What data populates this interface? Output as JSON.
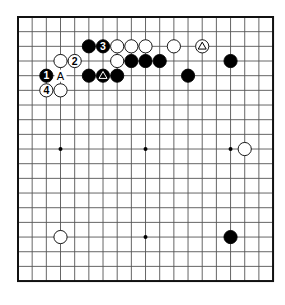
{
  "board": {
    "size": 19,
    "origin_x": 18,
    "origin_y": 17,
    "step_x": 14.17,
    "step_y": 14.67,
    "line_color": "#555555",
    "border_color": "#111111",
    "stone_black": "#000000",
    "stone_white": "#ffffff",
    "star_points": [
      [
        3,
        9
      ],
      [
        9,
        9
      ],
      [
        15,
        9
      ],
      [
        9,
        15
      ]
    ]
  },
  "stones": [
    {
      "color": "black",
      "col": 5,
      "row": 2,
      "label": ""
    },
    {
      "color": "black",
      "col": 6,
      "row": 2,
      "label": "3"
    },
    {
      "color": "white",
      "col": 7,
      "row": 2,
      "label": ""
    },
    {
      "color": "white",
      "col": 8,
      "row": 2,
      "label": ""
    },
    {
      "color": "white",
      "col": 9,
      "row": 2,
      "label": ""
    },
    {
      "color": "white",
      "col": 11,
      "row": 2,
      "label": ""
    },
    {
      "color": "white",
      "col": 13,
      "row": 2,
      "label": "triangle"
    },
    {
      "color": "white",
      "col": 3,
      "row": 3,
      "label": ""
    },
    {
      "color": "white",
      "col": 4,
      "row": 3,
      "label": "2"
    },
    {
      "color": "white",
      "col": 7,
      "row": 3,
      "label": ""
    },
    {
      "color": "black",
      "col": 8,
      "row": 3,
      "label": ""
    },
    {
      "color": "black",
      "col": 9,
      "row": 3,
      "label": ""
    },
    {
      "color": "black",
      "col": 10,
      "row": 3,
      "label": ""
    },
    {
      "color": "black",
      "col": 15,
      "row": 3,
      "label": ""
    },
    {
      "color": "black",
      "col": 2,
      "row": 4,
      "label": "1"
    },
    {
      "color": "black",
      "col": 5,
      "row": 4,
      "label": ""
    },
    {
      "color": "black",
      "col": 6,
      "row": 4,
      "label": "triangle"
    },
    {
      "color": "black",
      "col": 7,
      "row": 4,
      "label": ""
    },
    {
      "color": "black",
      "col": 12,
      "row": 4,
      "label": ""
    },
    {
      "color": "white",
      "col": 2,
      "row": 5,
      "label": "4"
    },
    {
      "color": "white",
      "col": 3,
      "row": 5,
      "label": ""
    },
    {
      "color": "white",
      "col": 16,
      "row": 9,
      "label": ""
    },
    {
      "color": "white",
      "col": 3,
      "row": 15,
      "label": ""
    },
    {
      "color": "black",
      "col": 15,
      "row": 15,
      "label": ""
    }
  ],
  "point_labels": [
    {
      "col": 3,
      "row": 4,
      "text": "A"
    }
  ]
}
